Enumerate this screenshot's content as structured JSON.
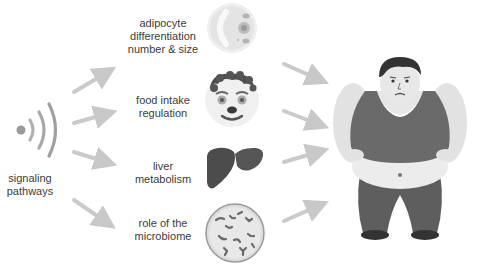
{
  "source": {
    "label_line1": "signaling",
    "label_line2": "pathways",
    "icon": "signal-waves-icon"
  },
  "factors": [
    {
      "line1": "adipocyte",
      "line2": "differentiation",
      "line3": "number & size",
      "icon": "adipocyte-cell-icon"
    },
    {
      "line1": "food intake",
      "line2": "regulation",
      "icon": "hungry-face-icon"
    },
    {
      "line1": "liver",
      "line2": "metabolism",
      "icon": "liver-icon"
    },
    {
      "line1": "role of  the",
      "line2": "microbiome",
      "icon": "microbiome-petri-icon"
    }
  ],
  "target": {
    "icon": "obese-man-icon"
  },
  "colors": {
    "arrow": "#c8c8c8",
    "text": "#3c3c3c",
    "dark": "#4a4a4a",
    "mid": "#6e6e6e",
    "light": "#e6e6e6"
  }
}
